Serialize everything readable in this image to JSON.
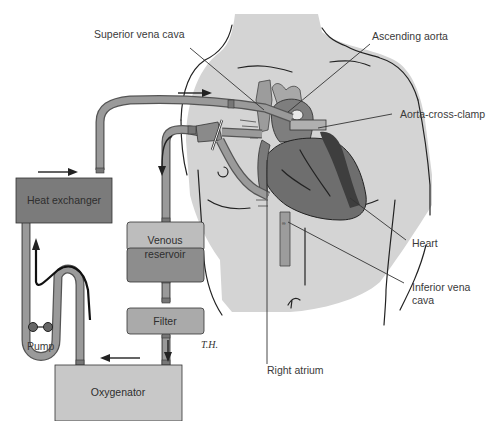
{
  "diagram": {
    "type": "cardiopulmonary-bypass-circuit",
    "colors": {
      "background": "#ffffff",
      "body_skin": "#d4d4d4",
      "heart": "#6e6e6e",
      "heart_dark": "#3e3e3e",
      "vessels": "#8e8e8e",
      "device_dark": "#7b7b7b",
      "device_light": "#bdbdbd",
      "tube": "#9a9a9a",
      "text": "#3a3a3a"
    },
    "labels": {
      "superior_vena_cava": "Superior vena cava",
      "ascending_aorta": "Ascending aorta",
      "aorta_cross_clamp": "Aorta-cross-clamp",
      "heart": "Heart",
      "inferior_vena_cava_line1": "Inferior vena",
      "inferior_vena_cava_line2": "cava",
      "right_atrium": "Right atrium",
      "pump": "Pump",
      "artist_signature": "T.H."
    },
    "devices": {
      "heat_exchanger": "Heat exchanger",
      "venous_reservoir_line1": "Venous",
      "venous_reservoir_line2": "reservoir",
      "filter": "Filter",
      "oxygenator": "Oxygenator"
    },
    "flow": [
      "Venous blood drains from right atrium / vena cavae",
      "Venous reservoir",
      "Filter",
      "Oxygenator",
      "Pump",
      "Heat exchanger",
      "Ascending aorta"
    ]
  }
}
